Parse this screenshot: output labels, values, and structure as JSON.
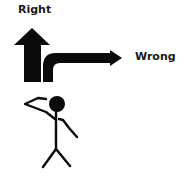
{
  "labels": {
    "top": "Right",
    "side": "Wrong"
  },
  "figure": {
    "up_arrow": "straight-ahead-arrow",
    "turn_arrow": "right-turn-arrow",
    "person": "saluting-stick-figure"
  },
  "colors": {
    "ink": "#0a0a0a",
    "text": "#1a1a1a",
    "background": "#ffffff"
  }
}
